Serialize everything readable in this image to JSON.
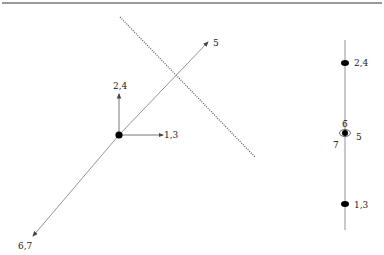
{
  "diagram": {
    "left": {
      "origin_labels": {
        "up": "2,4",
        "right": "1,3",
        "diag_up": "5",
        "diag_down": "6,7"
      }
    },
    "right": {
      "points": [
        {
          "label": "2,4"
        },
        {
          "label": "5",
          "above": "6̄",
          "below": "7̄"
        },
        {
          "label": "1,3"
        }
      ]
    }
  }
}
